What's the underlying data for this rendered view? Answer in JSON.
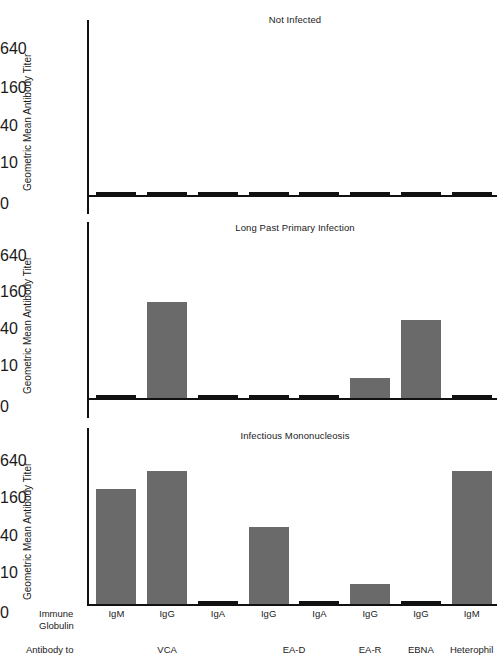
{
  "figure": {
    "width": 503,
    "height": 665,
    "bar_color": "#6a6a6a",
    "axis_color": "#111111",
    "background": "#ffffff",
    "y_axis_label": "Geometric Mean Antibody Titer"
  },
  "chart_data": {
    "type": "bar",
    "title": "",
    "xlabel": "",
    "ylabel": "Geometric Mean Antibody Titer",
    "ytick_labels": [
      "0",
      "10",
      "40",
      "160",
      "640"
    ],
    "ytick_values": [
      0,
      10,
      40,
      160,
      640
    ],
    "ylim": [
      0,
      1280
    ],
    "scale": "log-like (0, 10, 40, 160, 640)",
    "grid": false,
    "legend": "none",
    "categories": [
      "IgM",
      "IgG",
      "IgA",
      "IgG",
      "IgA",
      "IgG",
      "IgG",
      "IgM"
    ],
    "category_groups": [
      {
        "label": "VCA",
        "indices": [
          0,
          1,
          2
        ]
      },
      {
        "label": "EA-D",
        "indices": [
          3,
          4
        ]
      },
      {
        "label": "EA-R",
        "indices": [
          5
        ]
      },
      {
        "label": "EBNA",
        "indices": [
          6
        ]
      },
      {
        "label": "Heterophil",
        "indices": [
          7
        ]
      }
    ],
    "panels": [
      {
        "title": "Not Infected",
        "values": [
          0,
          0,
          0,
          0,
          0,
          0,
          0,
          0
        ]
      },
      {
        "title": "Long Past Primary Infection",
        "values": [
          0,
          80,
          0,
          0,
          0,
          5,
          40,
          0
        ]
      },
      {
        "title": "Infectious Mononucleosis",
        "values": [
          160,
          320,
          0,
          40,
          0,
          5,
          0,
          320
        ]
      }
    ]
  },
  "axis_rows": {
    "immune_globulin_label_line1": "Immune",
    "immune_globulin_label_line2": "Globulin",
    "antibody_to_label": "Antibody to"
  }
}
